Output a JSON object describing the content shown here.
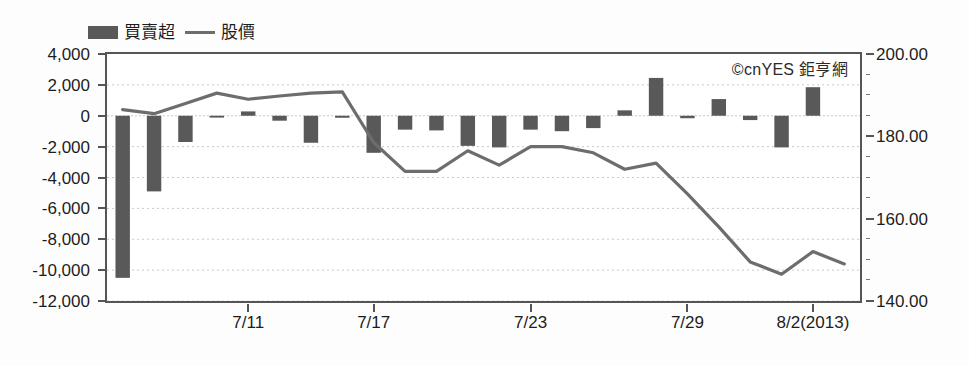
{
  "legend": {
    "items": [
      {
        "label": "買賣超",
        "marker": "bar-swatch",
        "color": "#595959"
      },
      {
        "label": "股價",
        "marker": "line-swatch",
        "color": "#6d6d6d"
      }
    ]
  },
  "watermark": {
    "text": "©cnYES 鉅亨網"
  },
  "chart_data": {
    "type": "bar",
    "title": "",
    "subtitle": "",
    "xlabel": "",
    "ylabel": "",
    "grid": true,
    "legend_position": "top-left",
    "x": [
      "7/8",
      "7/9",
      "7/10",
      "7/11",
      "7/12",
      "7/15",
      "7/16",
      "7/17",
      "7/18",
      "7/19",
      "7/22",
      "7/23",
      "7/24",
      "7/25",
      "7/26",
      "7/29",
      "7/30",
      "7/31",
      "8/1",
      "8/2",
      "8/5",
      "8/6",
      "8/7",
      "8/8"
    ],
    "x_tick_labels": [
      "7/11",
      "7/17",
      "7/23",
      "7/29",
      "8/2(2013)"
    ],
    "x_tick_indices": [
      4,
      8,
      13,
      18,
      22
    ],
    "series": [
      {
        "name": "買賣超",
        "type": "bar",
        "axis": "left",
        "color": "#595959",
        "values": [
          -10500,
          -4900,
          -1700,
          -120,
          280,
          -320,
          -1750,
          -130,
          -2400,
          -900,
          -950,
          -1950,
          -2050,
          -900,
          -1000,
          -800,
          350,
          2450,
          -160,
          1080,
          -280,
          -2050,
          1850,
          0
        ]
      },
      {
        "name": "股價",
        "type": "line",
        "axis": "right",
        "color": "#6d6d6d",
        "values": [
          186.5,
          185.5,
          188.0,
          190.5,
          189.0,
          189.8,
          190.5,
          190.8,
          178.5,
          171.5,
          171.5,
          176.5,
          173.0,
          177.5,
          177.5,
          176.0,
          172.0,
          173.5,
          166.0,
          158.0,
          149.5,
          146.5,
          152.0,
          149.0
        ]
      }
    ],
    "yaxis_left": {
      "label": "",
      "ticks": [
        "4,000",
        "2,000",
        "0",
        "-2,000",
        "-4,000",
        "-6,000",
        "-8,000",
        "-10,000",
        "-12,000"
      ],
      "values": [
        4000,
        2000,
        0,
        -2000,
        -4000,
        -6000,
        -8000,
        -10000,
        -12000
      ],
      "ylim": [
        -12000,
        4000
      ]
    },
    "yaxis_right": {
      "label": "",
      "ticks": [
        "200.00",
        "180.00",
        "160.00",
        "140.00"
      ],
      "values": [
        200.0,
        180.0,
        160.0,
        140.0
      ],
      "ylim": [
        140.0,
        200.0
      ],
      "minor_step": 5.0
    }
  }
}
